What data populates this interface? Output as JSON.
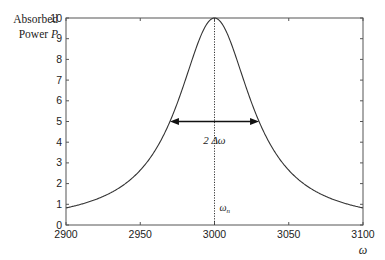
{
  "chart_data": {
    "type": "line",
    "title": "",
    "xlabel": "ω",
    "ylabel": "Absorbed Power P",
    "ylabel_lines": [
      "Absorbed",
      "Power",
      "P"
    ],
    "xlim": [
      2900,
      3100
    ],
    "ylim": [
      0,
      10
    ],
    "x_ticks": [
      2900,
      2950,
      3000,
      3050,
      3100
    ],
    "y_ticks": [
      0,
      1,
      2,
      3,
      4,
      5,
      6,
      7,
      8,
      9,
      10
    ],
    "grid": false,
    "legend": null,
    "series": [
      {
        "name": "Lorentzian absorption",
        "peak_x": 3000,
        "peak_y": 10,
        "half_width": 30,
        "x": [
          2900,
          2920,
          2940,
          2950,
          2960,
          2970,
          2980,
          2990,
          3000,
          3010,
          3020,
          3030,
          3040,
          3050,
          3060,
          3080,
          3100
        ],
        "y": [
          0.83,
          1.23,
          2.0,
          2.65,
          3.6,
          5.0,
          6.92,
          9.0,
          10.0,
          9.0,
          6.92,
          5.0,
          3.6,
          2.65,
          2.0,
          1.23,
          0.83
        ]
      }
    ],
    "annotations": [
      {
        "type": "vertical-dotted-line",
        "x": 3000,
        "label": "ω_n"
      },
      {
        "type": "double-arrow",
        "x_from": 2970,
        "x_to": 3030,
        "y": 5,
        "label": "2Δω"
      }
    ]
  },
  "labels": {
    "ylabel_line1": "Absorbed",
    "ylabel_line2": "Power",
    "ylabel_var": "P",
    "xlabel": "ω",
    "resonance": "ω",
    "resonance_sub": "n",
    "width": "2 Δω"
  }
}
